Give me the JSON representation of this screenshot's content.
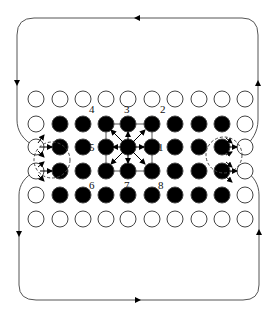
{
  "diagram": {
    "colors": {
      "line": "#555555",
      "filled_node": "#000000",
      "empty_node": "#ffffff",
      "node_stroke": "#444444",
      "arrow": "#000000"
    },
    "grid": {
      "columns_x": [
        36,
        60,
        83,
        106,
        128,
        152,
        175,
        199,
        222,
        245
      ],
      "rows_y": [
        99,
        124,
        147,
        171,
        195,
        219
      ],
      "rows": [
        "oooooooooo",
        "o########o",
        "o########o",
        "o########o",
        "o########o",
        "oooooooooo"
      ],
      "node_radius": 8
    },
    "neighbor_labels": [
      {
        "text": "4",
        "x": 92,
        "y": 113
      },
      {
        "text": "3",
        "x": 127,
        "y": 113
      },
      {
        "text": "2",
        "x": 162,
        "y": 113
      },
      {
        "text": "5",
        "x": 92,
        "y": 151
      },
      {
        "text": "1",
        "x": 160,
        "y": 151
      },
      {
        "text": "6",
        "x": 92,
        "y": 189
      },
      {
        "text": "7",
        "x": 126,
        "y": 189
      },
      {
        "text": "8",
        "x": 160,
        "y": 189
      }
    ],
    "center_node": {
      "col": 4,
      "row": 2
    },
    "top_loop_direction": "right-to-left",
    "bottom_loop_direction": "left-to-right"
  }
}
